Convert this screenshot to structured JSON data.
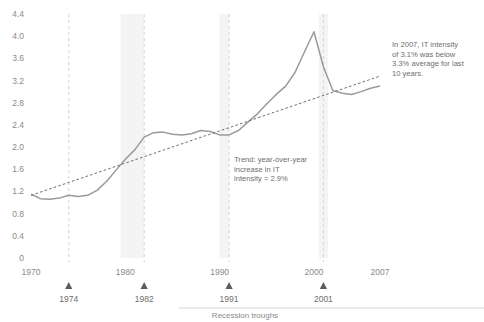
{
  "chart_data": {
    "type": "line",
    "title": "",
    "subtitle": "",
    "xlabel": "",
    "ylabel": "",
    "xlim": [
      1970,
      2007
    ],
    "ylim": [
      0,
      4.4
    ],
    "grid": false,
    "legend_position": "none",
    "y_ticks": [
      "0",
      "0.4",
      "0.8",
      "1.2",
      "1.6",
      "2.0",
      "2.4",
      "2.8",
      "3.2",
      "3.6",
      "4.0",
      "4.4"
    ],
    "y_tick_values": [
      0,
      0.4,
      0.8,
      1.2,
      1.6,
      2.0,
      2.4,
      2.8,
      3.2,
      3.6,
      4.0,
      4.4
    ],
    "x_ticks": [
      "1970",
      "1980",
      "1990",
      "2000",
      "2007"
    ],
    "x_tick_values": [
      1970,
      1980,
      1990,
      2000,
      2007
    ],
    "recession_troughs": [
      {
        "label": "1974",
        "year": 1974
      },
      {
        "label": "1982",
        "year": 1982
      },
      {
        "label": "1991",
        "year": 1991
      },
      {
        "label": "2001",
        "year": 2001
      }
    ],
    "recession_caption": "Recession troughs",
    "shaded_bands": [
      {
        "start": 1979.5,
        "end": 1982.0
      },
      {
        "start": 1990.0,
        "end": 1991.0
      },
      {
        "start": 2000.5,
        "end": 2001.5
      }
    ],
    "series": [
      {
        "name": "IT intensity",
        "style": "solid",
        "color": "#9a9a9a",
        "x": [
          1970,
          1971,
          1972,
          1973,
          1974,
          1975,
          1976,
          1977,
          1978,
          1979,
          1980,
          1981,
          1982,
          1983,
          1984,
          1985,
          1986,
          1987,
          1988,
          1989,
          1990,
          1991,
          1992,
          1993,
          1994,
          1995,
          1996,
          1997,
          1998,
          1999,
          2000,
          2001,
          2002,
          2003,
          2004,
          2005,
          2006,
          2007
        ],
        "values": [
          1.15,
          1.07,
          1.06,
          1.08,
          1.13,
          1.11,
          1.13,
          1.22,
          1.38,
          1.58,
          1.78,
          1.95,
          2.18,
          2.26,
          2.27,
          2.23,
          2.22,
          2.24,
          2.3,
          2.28,
          2.22,
          2.22,
          2.3,
          2.45,
          2.6,
          2.78,
          2.95,
          3.1,
          3.35,
          3.72,
          4.08,
          3.45,
          3.02,
          2.97,
          2.95,
          3.0,
          3.06,
          3.1
        ]
      },
      {
        "name": "Trend: year-over-year increase in IT intensity = 2.9%",
        "style": "dashed",
        "color": "#6e6e6e",
        "x": [
          1970,
          2007
        ],
        "values": [
          1.13,
          3.28
        ]
      }
    ],
    "annotations": [
      {
        "id": "trend-annotation",
        "lines": [
          "Trend: year-over-year",
          "increase in IT",
          "intensity = 2.9%"
        ]
      },
      {
        "id": "intensity-annotation",
        "lines": [
          "In 2007, IT intensity",
          "of 3.1% was below",
          "3.3% average for last",
          "10 years."
        ]
      }
    ]
  }
}
